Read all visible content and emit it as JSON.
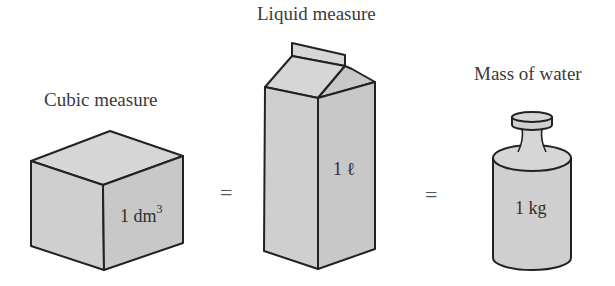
{
  "figure": {
    "items": [
      {
        "id": "cube",
        "title": "Cubic measure",
        "value": "1 dm",
        "superscript": "3"
      },
      {
        "id": "carton",
        "title": "Liquid measure",
        "value": "1 ℓ"
      },
      {
        "id": "weight",
        "title": "Mass of water",
        "value": "1 kg"
      }
    ],
    "equals": [
      "=",
      "="
    ],
    "colors": {
      "fill": "#cfcfcf",
      "stroke": "#222222",
      "text": "#3a3a3a",
      "background": "#ffffff"
    }
  }
}
